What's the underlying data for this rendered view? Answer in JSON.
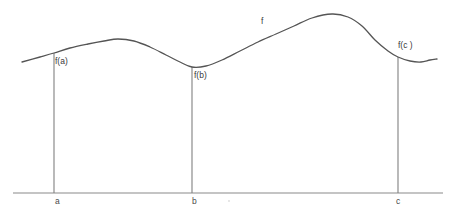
{
  "figure": {
    "background_color": "#ffffff",
    "curve_color": "#555555",
    "axis_color": "#8a8a8a",
    "ordinate_color": "#808080",
    "text_color": "#2f2f2f",
    "width": 456,
    "height": 221
  },
  "labels": {
    "curve_name": "f",
    "value_at_a": "f(a)",
    "value_at_b": "f(b)",
    "value_at_c": "f(c )",
    "axis_a": "a",
    "axis_b": "b",
    "axis_c": "c"
  },
  "chart_data": {
    "type": "line",
    "title": "",
    "xlabel": "",
    "ylabel": "",
    "grid": false,
    "legend": "none",
    "axis": {
      "baseline_y": 193,
      "x_start": 13,
      "x_end": 443
    },
    "marked_points": [
      {
        "label": "a",
        "x": 54,
        "curve_y": 53,
        "value_label": "f(a)"
      },
      {
        "label": "b",
        "x": 192,
        "curve_y": 67,
        "value_label": "f(b)"
      },
      {
        "label": "c",
        "x": 398,
        "curve_y": 57,
        "value_label": "f(c )"
      }
    ],
    "extrema": [
      {
        "kind": "local-maximum",
        "x": 118,
        "y": 39
      },
      {
        "kind": "local-minimum",
        "x": 192,
        "y": 67
      },
      {
        "kind": "global-maximum",
        "x": 332,
        "y": 14
      },
      {
        "kind": "local-minimum",
        "x": 421,
        "y": 62
      }
    ],
    "curve_points": [
      [
        22,
        62
      ],
      [
        40,
        57
      ],
      [
        54,
        53
      ],
      [
        70,
        48
      ],
      [
        88,
        44
      ],
      [
        104,
        41
      ],
      [
        118,
        39
      ],
      [
        134,
        41
      ],
      [
        150,
        47
      ],
      [
        166,
        55
      ],
      [
        180,
        62
      ],
      [
        192,
        67
      ],
      [
        206,
        66
      ],
      [
        222,
        60
      ],
      [
        240,
        51
      ],
      [
        258,
        42
      ],
      [
        276,
        34
      ],
      [
        294,
        26
      ],
      [
        312,
        18
      ],
      [
        332,
        14
      ],
      [
        348,
        17
      ],
      [
        362,
        26
      ],
      [
        375,
        40
      ],
      [
        388,
        51
      ],
      [
        398,
        57
      ],
      [
        410,
        61
      ],
      [
        421,
        62
      ],
      [
        430,
        60
      ],
      [
        437,
        59
      ]
    ]
  }
}
